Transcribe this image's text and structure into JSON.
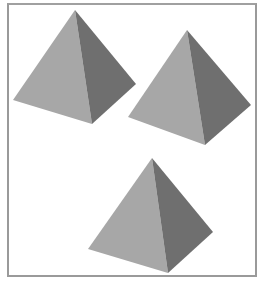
{
  "figure": {
    "colors": {
      "light_face": "#a7a7a7",
      "dark_face": "#6f6f6f",
      "border": "#9a9a9a",
      "background": "#ffffff"
    },
    "pyramids": [
      {
        "name": "pyramid-top-left",
        "apex": [
          75,
          10
        ],
        "left": [
          13,
          100
        ],
        "bottom": [
          92,
          124
        ],
        "right": [
          136,
          84
        ]
      },
      {
        "name": "pyramid-top-right",
        "apex": [
          187,
          30
        ],
        "left": [
          128,
          117
        ],
        "bottom": [
          205,
          145
        ],
        "right": [
          251,
          105
        ]
      },
      {
        "name": "pyramid-bottom",
        "apex": [
          152,
          158
        ],
        "left": [
          88,
          249
        ],
        "bottom": [
          168,
          273
        ],
        "right": [
          213,
          232
        ]
      }
    ]
  }
}
